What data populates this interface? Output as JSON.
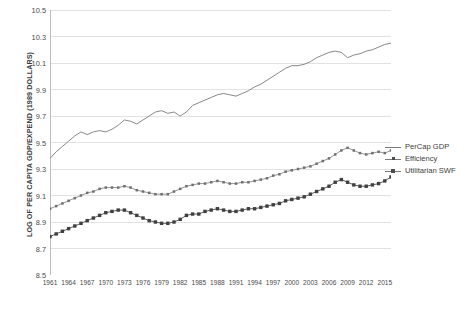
{
  "chart_data": {
    "type": "line",
    "title": "",
    "xlabel": "",
    "ylabel": "LOG OF PER CAPITA GDP/EXPEND (1989 DOLLARS)",
    "ylim": [
      8.5,
      10.5
    ],
    "yticks": [
      "8.5",
      "8.7",
      "8.9",
      "9.1",
      "9.3",
      "9.5",
      "9.7",
      "9.9",
      "10.1",
      "10.3",
      "10.5"
    ],
    "grid": true,
    "legend_position": "right",
    "x": [
      1961,
      1962,
      1963,
      1964,
      1965,
      1966,
      1967,
      1968,
      1969,
      1970,
      1971,
      1972,
      1973,
      1974,
      1975,
      1976,
      1977,
      1978,
      1979,
      1980,
      1981,
      1982,
      1983,
      1984,
      1985,
      1986,
      1987,
      1988,
      1989,
      1990,
      1991,
      1992,
      1993,
      1994,
      1995,
      1996,
      1997,
      1998,
      1999,
      2000,
      2001,
      2002,
      2003,
      2004,
      2005,
      2006,
      2007,
      2008,
      2009,
      2010,
      2011,
      2012,
      2013,
      2014,
      2015,
      2016
    ],
    "xticklabels": [
      "1961",
      "1964",
      "1967",
      "1970",
      "1973",
      "1976",
      "1979",
      "1982",
      "1985",
      "1988",
      "1991",
      "1994",
      "1997",
      "2000",
      "2003",
      "2006",
      "2009",
      "2012",
      "2015"
    ],
    "series": [
      {
        "name": "PerCap GDP",
        "marker": "none",
        "color": "#7a7a7a",
        "values": [
          9.38,
          9.43,
          9.47,
          9.51,
          9.55,
          9.58,
          9.56,
          9.58,
          9.59,
          9.58,
          9.6,
          9.63,
          9.67,
          9.66,
          9.64,
          9.67,
          9.7,
          9.73,
          9.74,
          9.72,
          9.73,
          9.7,
          9.73,
          9.78,
          9.8,
          9.82,
          9.84,
          9.86,
          9.87,
          9.86,
          9.85,
          9.87,
          9.89,
          9.92,
          9.94,
          9.97,
          10.0,
          10.03,
          10.06,
          10.08,
          10.08,
          10.09,
          10.11,
          10.14,
          10.16,
          10.18,
          10.19,
          10.18,
          10.14,
          10.16,
          10.17,
          10.19,
          10.2,
          10.22,
          10.24,
          10.25
        ]
      },
      {
        "name": "Efficiency",
        "marker": "dot",
        "color": "#8a8a8a",
        "values": [
          9.0,
          9.02,
          9.04,
          9.06,
          9.08,
          9.1,
          9.12,
          9.13,
          9.15,
          9.16,
          9.16,
          9.16,
          9.17,
          9.16,
          9.14,
          9.13,
          9.12,
          9.11,
          9.11,
          9.11,
          9.13,
          9.15,
          9.17,
          9.18,
          9.19,
          9.19,
          9.2,
          9.21,
          9.2,
          9.19,
          9.19,
          9.2,
          9.2,
          9.21,
          9.22,
          9.23,
          9.25,
          9.26,
          9.28,
          9.29,
          9.3,
          9.31,
          9.32,
          9.34,
          9.36,
          9.38,
          9.41,
          9.44,
          9.46,
          9.44,
          9.42,
          9.41,
          9.42,
          9.43,
          9.42,
          9.44
        ]
      },
      {
        "name": "Utilitarian SWF",
        "marker": "square",
        "color": "#4d4d4d",
        "values": [
          8.79,
          8.81,
          8.83,
          8.85,
          8.87,
          8.89,
          8.91,
          8.93,
          8.95,
          8.97,
          8.98,
          8.99,
          8.99,
          8.97,
          8.95,
          8.93,
          8.91,
          8.9,
          8.89,
          8.89,
          8.9,
          8.92,
          8.95,
          8.96,
          8.96,
          8.98,
          8.99,
          9.0,
          8.99,
          8.98,
          8.98,
          8.99,
          9.0,
          9.0,
          9.01,
          9.02,
          9.03,
          9.04,
          9.06,
          9.07,
          9.08,
          9.09,
          9.11,
          9.13,
          9.15,
          9.17,
          9.2,
          9.22,
          9.2,
          9.18,
          9.17,
          9.17,
          9.18,
          9.19,
          9.21,
          9.24
        ]
      }
    ]
  },
  "legend": {
    "items": [
      {
        "label": "PerCap GDP"
      },
      {
        "label": "Efficiency"
      },
      {
        "label": "Utilitarian SWF"
      }
    ]
  }
}
